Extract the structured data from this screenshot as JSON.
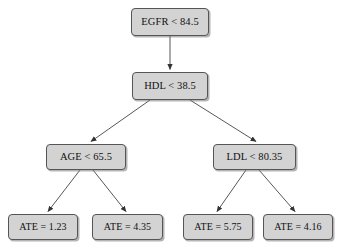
{
  "diagram": {
    "type": "decision-tree",
    "node_fill_color": "#d3d3d3",
    "node_border_color": "#555555",
    "edge_color": "#444444",
    "background_color": "#ffffff",
    "nodes": [
      {
        "id": "root",
        "label": "EGFR < 84.5",
        "kind": "internal",
        "level": 0
      },
      {
        "id": "hdl",
        "label": "HDL < 38.5",
        "kind": "internal",
        "level": 1
      },
      {
        "id": "age",
        "label": "AGE < 65.5",
        "kind": "internal",
        "level": 2
      },
      {
        "id": "ldl",
        "label": "LDL < 80.35",
        "kind": "internal",
        "level": 2
      },
      {
        "id": "leaf1",
        "label": "ATE = 1.23",
        "kind": "leaf",
        "level": 3
      },
      {
        "id": "leaf2",
        "label": "ATE = 4.35",
        "kind": "leaf",
        "level": 3
      },
      {
        "id": "leaf3",
        "label": "ATE = 5.75",
        "kind": "leaf",
        "level": 3
      },
      {
        "id": "leaf4",
        "label": "ATE = 4.16",
        "kind": "leaf",
        "level": 3
      }
    ],
    "edges": [
      {
        "from": "root",
        "to": "hdl"
      },
      {
        "from": "hdl",
        "to": "age"
      },
      {
        "from": "hdl",
        "to": "ldl"
      },
      {
        "from": "age",
        "to": "leaf1"
      },
      {
        "from": "age",
        "to": "leaf2"
      },
      {
        "from": "ldl",
        "to": "leaf3"
      },
      {
        "from": "ldl",
        "to": "leaf4"
      }
    ]
  }
}
